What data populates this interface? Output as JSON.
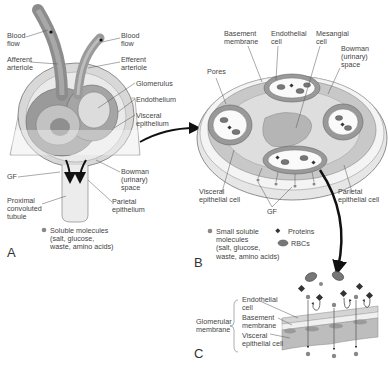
{
  "figure": {
    "panels": [
      {
        "id": "A",
        "letter": "A",
        "labels": {
          "blood_flow_left": "Blood\nflow",
          "afferent_arteriole": "Afferent\narteriole",
          "blood_flow_right": "Blood\nflow",
          "efferent_arteriole": "Efferent\narteriole",
          "glomerulus": "Glomerulus",
          "endothelium": "Endothelium",
          "visceral_epithelium": "Visceral\nepithelium",
          "gf": "GF",
          "bowman_space": "Bowman\n(urinary)\nspace",
          "proximal_tubule": "Proximal\nconvoluted\ntubule",
          "parietal_epithelium": "Parietal\nepithelium"
        },
        "legend": [
          {
            "symbol": "dot",
            "text": "Soluble molecules\n(salt, glucose,\nwaste, amino acids)"
          }
        ]
      },
      {
        "id": "B",
        "letter": "B",
        "labels": {
          "basement_membrane": "Basement\nmembrane",
          "endothelial_cell": "Endothelial\ncell",
          "mesangial_cell": "Mesangial\ncell",
          "bowman_space": "Bowman\n(urinary)\nspace",
          "pores": "Pores",
          "visceral_epithelial_cell": "Visceral\nepithelial cell",
          "parietal_epithelial_cell": "Parietal\nepithelial cell",
          "gf": "GF"
        },
        "legend": [
          {
            "symbol": "dot",
            "text": "Small soluble\nmolecules\n(salt, glucose,\nwaste, amino acids)"
          },
          {
            "symbol": "diamond",
            "text": "Proteins"
          },
          {
            "symbol": "rbc",
            "text": "RBCs"
          }
        ]
      },
      {
        "id": "C",
        "letter": "C",
        "labels": {
          "glomerular_membrane": "Glomerular\nmembrane",
          "endothelial_cell": "Endothelial\ncell",
          "basement_membrane": "Basement\nmembrane",
          "visceral_epithelial_cell": "Visceral\nepithelial cell"
        }
      }
    ],
    "colors": {
      "tissue_dark": "#8a8a8a",
      "tissue_mid": "#a9a9a9",
      "tissue_light": "#cfcfcf",
      "tissue_pale": "#e4e4e4",
      "outline": "#5a5a5a",
      "arrow": "#111111",
      "text": "#444444"
    }
  }
}
